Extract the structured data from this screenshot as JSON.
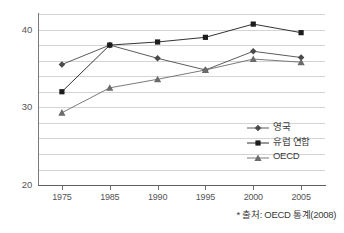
{
  "chart_data": {
    "type": "line",
    "title": "",
    "xlabel": "",
    "ylabel": "",
    "categories": [
      "1975",
      "1985",
      "1990",
      "1995",
      "2000",
      "2005"
    ],
    "ylim": [
      20,
      42
    ],
    "ytick_labels": [
      "40",
      "30",
      "20"
    ],
    "ytick_values": [
      40,
      30,
      20
    ],
    "gridlines": [
      42,
      40,
      38,
      36,
      34,
      32,
      30,
      28,
      26,
      24,
      22,
      20
    ],
    "grid": true,
    "legend_position": "inside-lower-right",
    "series": [
      {
        "name": "영국",
        "marker": "diamond",
        "color": "#4a4a4a",
        "values": [
          35.5,
          38.0,
          36.3,
          34.8,
          37.2,
          36.4
        ]
      },
      {
        "name": "유럽 연합",
        "marker": "square",
        "color": "#1c1c1c",
        "values": [
          32.0,
          38.0,
          38.4,
          39.0,
          40.7,
          39.6
        ]
      },
      {
        "name": "OECD",
        "marker": "triangle",
        "color": "#6b6b6b",
        "values": [
          29.3,
          32.5,
          33.6,
          34.8,
          36.2,
          35.8
        ]
      }
    ],
    "annotations": {
      "source_note": "* 출처: OECD 통계(2008)"
    }
  },
  "legend": {
    "entries": [
      {
        "label": "영국"
      },
      {
        "label": "유럽 연합"
      },
      {
        "label": "OECD"
      }
    ]
  },
  "source": {
    "text": "* 출처: OECD 통계(2008)"
  }
}
